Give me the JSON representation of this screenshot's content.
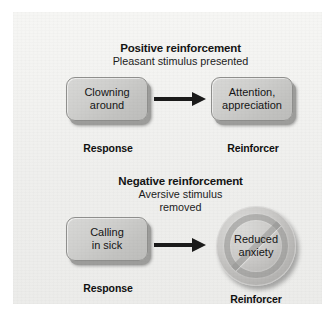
{
  "figure": {
    "background_color": "#ffffff",
    "panel_color": "#f2f2f0"
  },
  "sections": [
    {
      "id": "positive",
      "title": "Positive reinforcement",
      "subtitle": "Pleasant stimulus presented",
      "response": {
        "text": "Clowning\naround",
        "caption": "Response",
        "shape": "rounded-box"
      },
      "reinforcer": {
        "text": "Attention,\nappreciation",
        "caption": "Reinforcer",
        "shape": "rounded-box"
      },
      "connector": "arrow-right"
    },
    {
      "id": "negative",
      "title": "Negative reinforcement",
      "subtitle": "Aversive stimulus\nremoved",
      "response": {
        "text": "Calling\nin sick",
        "caption": "Response",
        "shape": "rounded-box"
      },
      "reinforcer": {
        "text": "Reduced\nanxiety",
        "caption": "Reinforcer",
        "shape": "circle-with-prohibition-sign"
      },
      "connector": "arrow-right"
    }
  ],
  "colors": {
    "box_fill": "#cfcfcd",
    "box_border": "#8f8f8d",
    "box_shadow": "#9d9d9b",
    "circle_fill": "#cccbc9",
    "arrow": "#1a1a1a",
    "text": "#141414"
  }
}
